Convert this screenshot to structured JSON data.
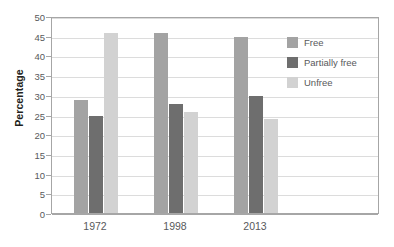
{
  "chart_data": {
    "type": "bar",
    "title": "",
    "xlabel": "",
    "ylabel": "Percentage",
    "categories": [
      "1972",
      "1998",
      "2013"
    ],
    "series": [
      {
        "name": "Free",
        "color": "#a3a3a3",
        "values": [
          29,
          46,
          45
        ]
      },
      {
        "name": "Partially free",
        "color": "#6e6e6e",
        "values": [
          25,
          28,
          30
        ]
      },
      {
        "name": "Unfree",
        "color": "#d2d2d2",
        "values": [
          46,
          26,
          24
        ]
      }
    ],
    "ylim": [
      0,
      50
    ],
    "yticks": [
      0,
      5,
      10,
      15,
      20,
      25,
      30,
      35,
      40,
      45,
      50
    ],
    "ytick_labels": [
      "0",
      "5",
      "10",
      "15",
      "20",
      "25",
      "30",
      "35",
      "40",
      "45",
      "50"
    ],
    "grid": true,
    "legend_position": "inside-right"
  }
}
